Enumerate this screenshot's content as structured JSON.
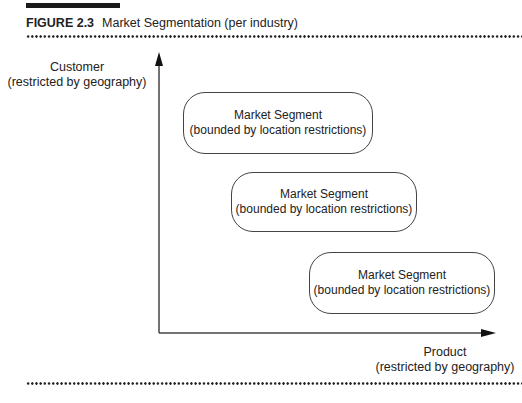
{
  "figure": {
    "number": "FIGURE 2.3",
    "title": "Market Segmentation (per industry)"
  },
  "axes": {
    "y": {
      "line1": "Customer",
      "line2": "(restricted by geography)"
    },
    "x": {
      "line1": "Product",
      "line2": "(restricted by geography)"
    }
  },
  "segments": [
    {
      "line1": "Market Segment",
      "line2": "(bounded by location restrictions)"
    },
    {
      "line1": "Market Segment",
      "line2": "(bounded by location restrictions)"
    },
    {
      "line1": "Market Segment",
      "line2": "(bounded by location restrictions)"
    }
  ]
}
